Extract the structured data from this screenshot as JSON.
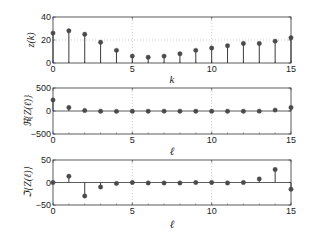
{
  "chart_data": [
    {
      "type": "stem",
      "title": "",
      "xlabel": "k",
      "ylabel": "z(k)",
      "xlim": [
        0,
        15
      ],
      "ylim": [
        0,
        40
      ],
      "xticks": [
        "0",
        "5",
        "10",
        "15"
      ],
      "yticks": [
        "0",
        "20",
        "40"
      ],
      "grid": true,
      "x": [
        0,
        1,
        2,
        3,
        4,
        5,
        6,
        7,
        8,
        9,
        10,
        11,
        12,
        13,
        14,
        15
      ],
      "values": [
        26,
        28,
        25,
        18,
        11,
        6,
        5,
        6,
        8,
        11,
        13,
        15,
        17,
        17,
        19,
        22
      ]
    },
    {
      "type": "stem",
      "title": "",
      "xlabel": "ℓ",
      "ylabel": "ℜ{Z(ℓ)}",
      "xlim": [
        0,
        15
      ],
      "ylim": [
        -500,
        500
      ],
      "xticks": [
        "0",
        "5",
        "10",
        "15"
      ],
      "yticks": [
        "-500",
        "0",
        "500"
      ],
      "grid": true,
      "x": [
        0,
        1,
        2,
        3,
        4,
        5,
        6,
        7,
        8,
        9,
        10,
        11,
        12,
        13,
        14,
        15
      ],
      "values": [
        240,
        75,
        10,
        -5,
        -8,
        -5,
        -5,
        -3,
        -5,
        -5,
        -5,
        -5,
        -5,
        -3,
        20,
        75
      ]
    },
    {
      "type": "stem",
      "title": "",
      "xlabel": "ℓ",
      "ylabel": "ℑ{Z(ℓ)}",
      "xlim": [
        0,
        15
      ],
      "ylim": [
        -50,
        50
      ],
      "xticks": [
        "0",
        "5",
        "10",
        "15"
      ],
      "yticks": [
        "-50",
        "0",
        "50"
      ],
      "grid": true,
      "x": [
        0,
        1,
        2,
        3,
        4,
        5,
        6,
        7,
        8,
        9,
        10,
        11,
        12,
        13,
        14,
        15
      ],
      "values": [
        0,
        14,
        -30,
        -10,
        -2,
        0,
        -1,
        -1,
        -1,
        0,
        0,
        -1,
        0,
        8,
        29,
        -15
      ]
    }
  ],
  "labels": {
    "top_ylabel": "z(k)",
    "top_xlabel": "k",
    "mid_ylabel": "ℜ{Z(ℓ)}",
    "mid_xlabel": "ℓ",
    "bot_ylabel": "ℑ{Z(ℓ)}",
    "bot_xlabel": "ℓ"
  },
  "colors": {
    "marker": "#4a4a4a",
    "stem": "#3a3a3a",
    "axis": "#333333",
    "grid": "#b0b0b0"
  }
}
